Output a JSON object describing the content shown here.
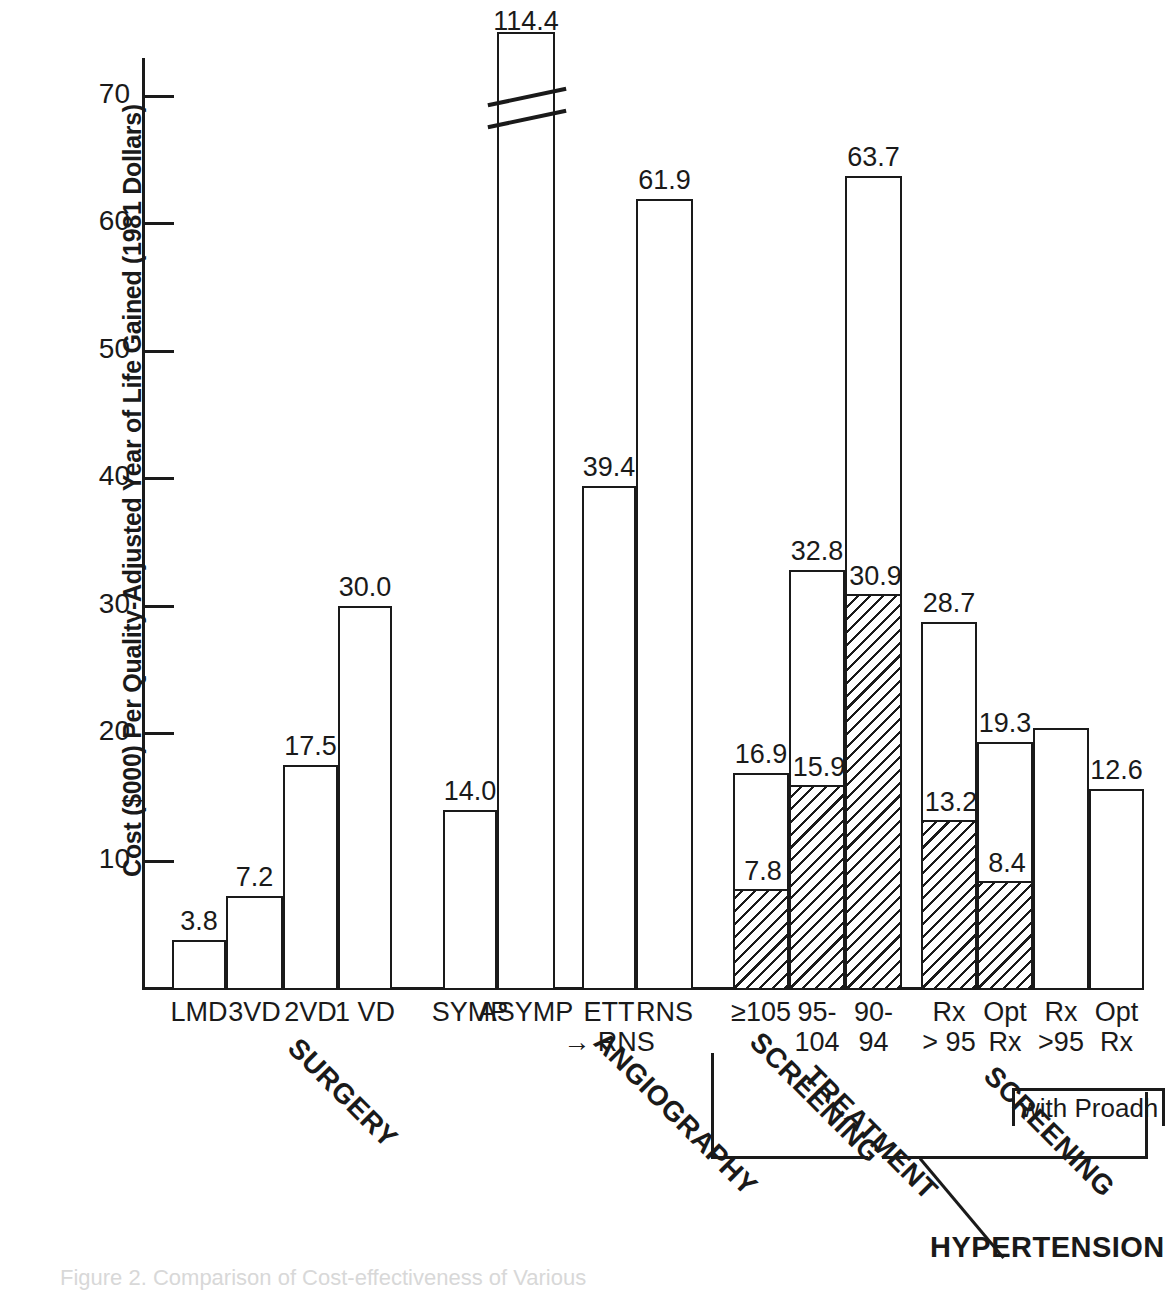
{
  "figure": {
    "caption": "Figure 2. Comparison of Cost-effectiveness of Various"
  },
  "chart_data": {
    "type": "bar",
    "title": "",
    "xlabel": "",
    "ylabel": "Cost ($000) Per Quality-Adjusted Year of Life Gained (1981 Dollars)",
    "ylim": [
      0,
      75
    ],
    "yticks": [
      10,
      20,
      30,
      40,
      50,
      60,
      70
    ],
    "ytick_labels": [
      "10",
      "20",
      "30",
      "40",
      "50",
      "60",
      "70"
    ],
    "grid": false,
    "legend": "none",
    "axis_break_note": "The ASYMP bar (114.4) is drawn with an axis break",
    "categories": [
      "LMD",
      "3VD",
      "2VD",
      "1 VD",
      "SYMP",
      "ASYMP",
      "ETT\n→ RNS",
      "RNS",
      "≥105",
      "95-\n104",
      "90-\n94",
      "Rx\n> 95",
      "Opt\nRx",
      "Rx\n>95",
      "Opt\nRx"
    ],
    "bars": [
      {
        "label": "LMD",
        "group": "SURGERY",
        "total": 3.8,
        "total_text": "3.8",
        "hatched": null
      },
      {
        "label": "3VD",
        "group": "SURGERY",
        "total": 7.2,
        "total_text": "7.2",
        "hatched": null
      },
      {
        "label": "2VD",
        "group": "SURGERY",
        "total": 17.5,
        "total_text": "17.5",
        "hatched": null
      },
      {
        "label": "1 VD",
        "group": "SURGERY",
        "total": 30.0,
        "total_text": "30.0",
        "hatched": null
      },
      {
        "label": "SYMP",
        "group": "ANGIOGRAPHY",
        "total": 14.0,
        "total_text": "14.0",
        "hatched": null
      },
      {
        "label": "ASYMP",
        "group": "ANGIOGRAPHY",
        "total": 114.4,
        "total_text": "114.4",
        "hatched": null,
        "broken": true
      },
      {
        "label": "ETT\n→ RNS",
        "group": "SCREENING",
        "total": 39.4,
        "total_text": "39.4",
        "hatched": null
      },
      {
        "label": "RNS",
        "group": "SCREENING",
        "total": 61.9,
        "total_text": "61.9",
        "hatched": null
      },
      {
        "label": "≥105",
        "group": "TREATMENT",
        "total": 16.9,
        "total_text": "16.9",
        "hatched": 7.8,
        "hatched_text": "7.8"
      },
      {
        "label": "95-\n104",
        "group": "TREATMENT",
        "total": 32.8,
        "total_text": "32.8",
        "hatched": 15.9,
        "hatched_text": "15.9"
      },
      {
        "label": "90-\n94",
        "group": "TREATMENT",
        "total": 63.7,
        "total_text": "63.7",
        "hatched": 30.9,
        "hatched_text": "30.9"
      },
      {
        "label": "Rx\n> 95",
        "group": "SCREENING2",
        "total": 28.7,
        "total_text": "28.7",
        "hatched": 13.2,
        "hatched_text": "13.2"
      },
      {
        "label": "Opt\nRx",
        "group": "SCREENING2",
        "total": 19.3,
        "total_text": "19.3",
        "hatched": 8.4,
        "hatched_text": "8.4"
      },
      {
        "label": "Rx\n>95",
        "group": "SCREENING2",
        "total": 20.4,
        "total_text": "",
        "hatched": null
      },
      {
        "label": "Opt\nRx",
        "group": "SCREENING2",
        "total": 15.6,
        "total_text": "12.6",
        "hatched": null
      }
    ],
    "group_labels": [
      {
        "name": "SURGERY"
      },
      {
        "name": "ANGIOGRAPHY"
      },
      {
        "name": "SCREENING"
      },
      {
        "name": "TREATMENT"
      },
      {
        "name": "SCREENING"
      }
    ],
    "annotations": [
      {
        "name": "hypertension",
        "text": "HYPERTENSION"
      },
      {
        "name": "proadherence",
        "text": "with Proadh"
      }
    ]
  }
}
